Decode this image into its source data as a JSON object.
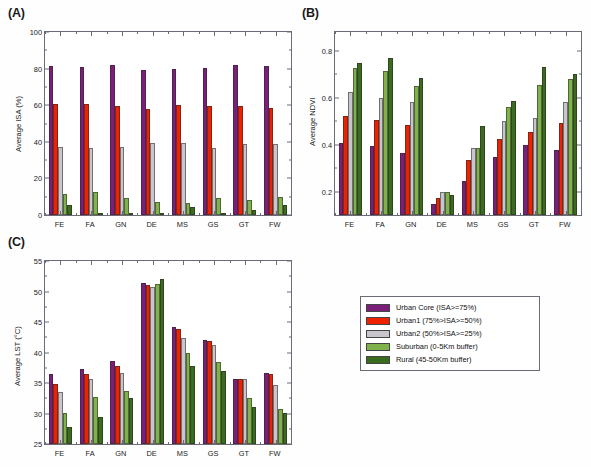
{
  "figure": {
    "background": "#ffffff",
    "panels": [
      {
        "tag": "(A)",
        "id": "panel-a"
      },
      {
        "tag": "(B)",
        "id": "panel-b"
      },
      {
        "tag": "(C)",
        "id": "panel-c"
      }
    ]
  },
  "legend": {
    "name": "series-legend",
    "entries": [
      {
        "label": "Urban Core (ISA>=75%)",
        "color": "#7B1F7B"
      },
      {
        "label": "Urban1 (75%>ISA>=50%)",
        "color": "#EE2200"
      },
      {
        "label": "Urban2 (50%>ISA>=25%)",
        "color": "#C8C6CC"
      },
      {
        "label": "Suburban (0-5Km buffer)",
        "color": "#7FB24B"
      },
      {
        "label": "Rural (45-50Km buffer)",
        "color": "#3A6B1E"
      }
    ]
  },
  "chart_data": [
    {
      "id": "panel-a",
      "type": "bar",
      "title": "Fractional ISA for Cities by Biome",
      "xlabel": "",
      "ylabel": "Average ISA (%)",
      "ylim": [
        0,
        100
      ],
      "yticks": [
        0,
        20,
        40,
        60,
        80,
        100
      ],
      "grid": false,
      "legend_position": "external",
      "categories": [
        "FE",
        "FA",
        "GN",
        "DE",
        "MS",
        "GS",
        "GT",
        "FW"
      ],
      "series": [
        {
          "name": "Urban Core (ISA>=75%)",
          "color": "#7B1F7B",
          "values": [
            81.7,
            81.0,
            81.8,
            79.1,
            79.6,
            80.2,
            81.9,
            81.3
          ]
        },
        {
          "name": "Urban1 (75%>ISA>=50%)",
          "color": "#EE2200",
          "values": [
            60.4,
            60.8,
            59.7,
            57.8,
            59.9,
            59.6,
            59.3,
            58.4
          ]
        },
        {
          "name": "Urban2 (50%>ISA>=25%)",
          "color": "#C8C6CC",
          "values": [
            37.2,
            36.5,
            37.1,
            39.3,
            39.4,
            36.7,
            38.9,
            38.7
          ]
        },
        {
          "name": "Suburban (0-5Km buffer)",
          "color": "#7FB24B",
          "values": [
            11.7,
            12.5,
            9.2,
            6.9,
            6.3,
            9.5,
            8.0,
            10.0
          ]
        },
        {
          "name": "Rural (45-50Km buffer)",
          "color": "#3A6B1E",
          "values": [
            5.3,
            1.2,
            0.8,
            0.7,
            4.6,
            0.9,
            2.9,
            5.4
          ]
        }
      ]
    },
    {
      "id": "panel-b",
      "type": "bar",
      "title": "Jun-Aug NDVI for Cities by Biome",
      "xlabel": "",
      "ylabel": "Average NDVI",
      "ylim": [
        0.1,
        0.88
      ],
      "yticks": [
        0.2,
        0.4,
        0.6,
        0.8
      ],
      "ytick_labels": [
        "0.2",
        "0.4",
        "0.6",
        "0.8"
      ],
      "grid": false,
      "legend_position": "external",
      "categories": [
        "FE",
        "FA",
        "GN",
        "DE",
        "MS",
        "GS",
        "GT",
        "FW"
      ],
      "series": [
        {
          "name": "Urban Core (ISA>=75%)",
          "color": "#7B1F7B",
          "values": [
            0.405,
            0.394,
            0.363,
            0.148,
            0.243,
            0.349,
            0.397,
            0.377
          ]
        },
        {
          "name": "Urban1 (75%>ISA>=50%)",
          "color": "#EE2200",
          "values": [
            0.523,
            0.505,
            0.485,
            0.172,
            0.334,
            0.423,
            0.452,
            0.494
          ]
        },
        {
          "name": "Urban2 (50%>ISA>=25%)",
          "color": "#C8C6CC",
          "values": [
            0.624,
            0.597,
            0.58,
            0.196,
            0.387,
            0.502,
            0.512,
            0.58
          ]
        },
        {
          "name": "Suburban (0-5Km buffer)",
          "color": "#7FB24B",
          "values": [
            0.726,
            0.712,
            0.65,
            0.196,
            0.387,
            0.559,
            0.654,
            0.68
          ]
        },
        {
          "name": "Rural (45-50Km buffer)",
          "color": "#3A6B1E",
          "values": [
            0.749,
            0.769,
            0.682,
            0.186,
            0.48,
            0.586,
            0.729,
            0.703
          ]
        }
      ]
    },
    {
      "id": "panel-c",
      "type": "bar",
      "title": "Jun-Aug midday LST for Cities by Biome",
      "xlabel": "",
      "ylabel": "Average LST (°C)",
      "ylim": [
        25,
        55
      ],
      "yticks": [
        25,
        30,
        35,
        40,
        45,
        50,
        55
      ],
      "grid": false,
      "legend_position": "external",
      "categories": [
        "FE",
        "FA",
        "GN",
        "DE",
        "MS",
        "GS",
        "GT",
        "FW"
      ],
      "series": [
        {
          "name": "Urban Core (ISA>=75%)",
          "color": "#7B1F7B",
          "values": [
            36.4,
            37.3,
            38.6,
            51.4,
            44.2,
            42.1,
            35.6,
            36.7
          ]
        },
        {
          "name": "Urban1 (75%>ISA>=50%)",
          "color": "#EE2200",
          "values": [
            34.9,
            36.4,
            37.8,
            51.0,
            43.8,
            41.9,
            35.6,
            36.4
          ]
        },
        {
          "name": "Urban2 (50%>ISA>=25%)",
          "color": "#C8C6CC",
          "values": [
            33.5,
            35.6,
            36.6,
            50.7,
            42.3,
            41.3,
            35.7,
            34.7
          ]
        },
        {
          "name": "Suburban (0-5Km buffer)",
          "color": "#7FB24B",
          "values": [
            30.1,
            32.7,
            33.7,
            51.3,
            40.0,
            38.5,
            32.6,
            30.8
          ]
        },
        {
          "name": "Rural (45-50Km buffer)",
          "color": "#3A6B1E",
          "values": [
            27.8,
            29.5,
            32.5,
            52.0,
            37.8,
            36.9,
            31.0,
            30.1
          ]
        }
      ]
    }
  ]
}
